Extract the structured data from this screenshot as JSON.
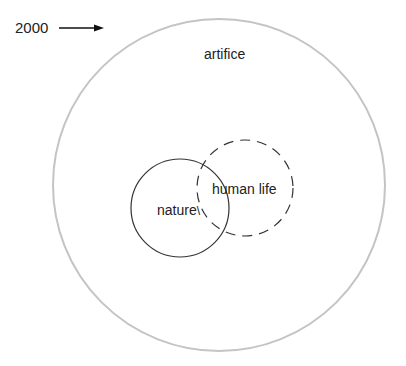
{
  "diagram": {
    "marker": {
      "label": "2000",
      "arrow": "right-arrow"
    },
    "outer": {
      "label": "artifice",
      "stroke": "#c4c4c4",
      "style": "solid"
    },
    "nature": {
      "label": "nature",
      "stroke": "#333333",
      "style": "solid"
    },
    "human_life": {
      "label": "human life",
      "stroke": "#333333",
      "style": "dashed"
    }
  }
}
